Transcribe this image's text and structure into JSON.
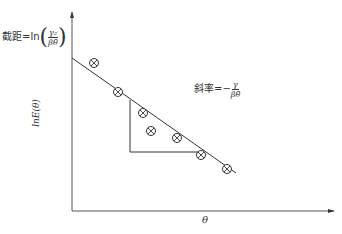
{
  "chart_data": {
    "type": "scatter",
    "title": "",
    "xlabel": "θ",
    "ylabel": "lnE(θ)",
    "grid": false,
    "legend": "none",
    "points_pixel": [
      {
        "x": 94,
        "y": 63
      },
      {
        "x": 118,
        "y": 92
      },
      {
        "x": 143,
        "y": 113
      },
      {
        "x": 151,
        "y": 131
      },
      {
        "x": 177,
        "y": 138
      },
      {
        "x": 201,
        "y": 155
      },
      {
        "x": 227,
        "y": 169
      }
    ],
    "fit_line_pixel": {
      "x1": 72,
      "y1": 58,
      "x2": 236,
      "y2": 173
    },
    "slope_triangle_pixel": {
      "top": [
        130,
        100
      ],
      "corner": [
        130,
        152
      ],
      "right": [
        199,
        152
      ]
    },
    "annotations": [
      {
        "text": "截距=ln(γ2/(βθ̄))",
        "role": "intercept"
      },
      {
        "text": "斜率=−γ/(βθ̄)",
        "role": "slope"
      }
    ],
    "marker": "circle-with-x"
  },
  "labels": {
    "intercept_prefix": "截距=ln",
    "intercept_num": "γ₂",
    "intercept_den": "βθ̄",
    "slope_prefix": "斜率=−",
    "slope_num": "γ",
    "slope_den": "βθ̄",
    "y_axis": "lnE(θ)",
    "x_axis": "θ"
  },
  "colors": {
    "line": "#333333",
    "marker": "#333333",
    "background": "#ffffff"
  }
}
